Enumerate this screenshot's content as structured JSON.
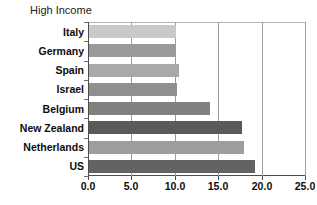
{
  "chart_data": {
    "type": "bar",
    "orientation": "horizontal",
    "title": "High Income",
    "xlabel": "",
    "ylabel": "",
    "categories": [
      "Italy",
      "Germany",
      "Spain",
      "Israel",
      "Belgium",
      "New Zealand",
      "Netherlands",
      "US"
    ],
    "values": [
      10.0,
      9.9,
      10.4,
      10.1,
      13.9,
      17.6,
      17.8,
      19.1
    ],
    "xlim": [
      0.0,
      25.0
    ],
    "xticks": [
      0.0,
      5.0,
      10.0,
      15.0,
      20.0,
      25.0
    ],
    "xticklabels": [
      "0.0",
      "5.0",
      "10.0",
      "15.0",
      "20.0",
      "25.0"
    ],
    "grid": true,
    "grid_axis": "x",
    "legend": false,
    "bar_colors": [
      "#c9c9c9",
      "#9a9a9a",
      "#a9a9a9",
      "#8f8f8f",
      "#808080",
      "#5a5a5a",
      "#9e9e9e",
      "#636363"
    ]
  },
  "axes": {
    "frame_color": "#4d4d4d",
    "gridline_color": "#9d9d9d",
    "background": "#ffffff"
  }
}
